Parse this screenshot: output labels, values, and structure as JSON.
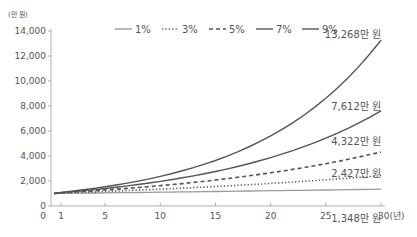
{
  "chart_data": {
    "type": "line",
    "title": "",
    "xlabel": "(년)",
    "ylabel": "(만 원)",
    "x": [
      0,
      1,
      2,
      3,
      4,
      5,
      6,
      7,
      8,
      9,
      10,
      11,
      12,
      13,
      14,
      15,
      16,
      17,
      18,
      19,
      20,
      21,
      22,
      23,
      24,
      25,
      26,
      27,
      28,
      29,
      30
    ],
    "xticks": [
      0,
      1,
      5,
      10,
      15,
      20,
      25,
      30
    ],
    "xtick_labels": [
      "0",
      "1",
      "5",
      "10",
      "15",
      "20",
      "25",
      "30(년)"
    ],
    "yticks": [
      0,
      2000,
      4000,
      6000,
      8000,
      10000,
      12000,
      14000
    ],
    "ytick_labels": [
      "0",
      "2,000",
      "4,000",
      "6,000",
      "8,000",
      "10,000",
      "12,000",
      "14,000"
    ],
    "ylim": [
      0,
      14000
    ],
    "xlim": [
      0,
      30
    ],
    "principal": 1000,
    "series": [
      {
        "name": "1%",
        "rate": 0.01,
        "style": "solid-light",
        "color": "#9a9a9a",
        "final_value": 1348,
        "end_label": "1,348만 원"
      },
      {
        "name": "3%",
        "rate": 0.03,
        "style": "dotted",
        "color": "#555555",
        "final_value": 2427,
        "end_label": "2,427만 원"
      },
      {
        "name": "5%",
        "rate": 0.05,
        "style": "dashed",
        "color": "#555555",
        "final_value": 4322,
        "end_label": "4,322만 원"
      },
      {
        "name": "7%",
        "rate": 0.07,
        "style": "solid",
        "color": "#555555",
        "final_value": 7612,
        "end_label": "7,612만 원"
      },
      {
        "name": "9%",
        "rate": 0.09,
        "style": "solid",
        "color": "#555555",
        "final_value": 13268,
        "end_label": "13,268만 원"
      }
    ],
    "legend_position": "top",
    "grid": false
  }
}
